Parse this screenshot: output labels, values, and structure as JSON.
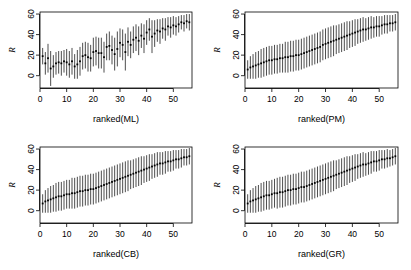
{
  "figure": {
    "layout": "2x2",
    "background": "#ffffff",
    "ink": "#000000"
  },
  "chart_data": [
    {
      "type": "scatter",
      "panel": "top-left",
      "title": "",
      "xlabel": "ranked(ML)",
      "ylabel": "R",
      "xlim": [
        0,
        57
      ],
      "ylim": [
        -12,
        62
      ],
      "xticks": [
        0,
        10,
        20,
        30,
        40,
        50
      ],
      "yticks": [
        0,
        20,
        40,
        60
      ],
      "grid": false,
      "errorbars": true,
      "x": [
        1,
        2,
        3,
        4,
        5,
        6,
        7,
        8,
        9,
        10,
        11,
        12,
        13,
        14,
        15,
        16,
        17,
        18,
        19,
        20,
        21,
        22,
        23,
        24,
        25,
        26,
        27,
        28,
        29,
        30,
        31,
        32,
        33,
        34,
        35,
        36,
        37,
        38,
        39,
        40,
        41,
        42,
        43,
        44,
        45,
        46,
        47,
        48,
        49,
        50,
        51,
        52,
        53,
        54,
        55,
        56
      ],
      "values": [
        19,
        12,
        17,
        7,
        9,
        12,
        13,
        12,
        14,
        13,
        11,
        14,
        9,
        11,
        14,
        19,
        20,
        18,
        17,
        23,
        24,
        22,
        22,
        18,
        28,
        29,
        25,
        21,
        26,
        32,
        30,
        23,
        33,
        30,
        35,
        37,
        34,
        39,
        36,
        42,
        45,
        38,
        41,
        44,
        43,
        46,
        45,
        48,
        47,
        49,
        48,
        50,
        52,
        51,
        53,
        52
      ],
      "err_low": [
        8,
        11,
        14,
        17,
        11,
        11,
        11,
        12,
        11,
        13,
        13,
        13,
        12,
        14,
        14,
        13,
        13,
        14,
        13,
        14,
        14,
        15,
        15,
        15,
        13,
        14,
        14,
        16,
        17,
        14,
        15,
        18,
        14,
        13,
        13,
        13,
        14,
        12,
        14,
        12,
        11,
        16,
        13,
        11,
        12,
        10,
        11,
        9,
        10,
        9,
        9,
        8,
        7,
        8,
        7,
        8
      ],
      "err_high": [
        8,
        11,
        14,
        17,
        11,
        11,
        11,
        12,
        11,
        13,
        13,
        13,
        12,
        14,
        14,
        13,
        13,
        14,
        13,
        14,
        14,
        15,
        15,
        15,
        13,
        14,
        14,
        16,
        17,
        14,
        15,
        18,
        14,
        13,
        13,
        13,
        14,
        12,
        14,
        12,
        11,
        16,
        13,
        11,
        12,
        10,
        11,
        9,
        10,
        9,
        9,
        8,
        7,
        8,
        7,
        8
      ]
    },
    {
      "type": "scatter",
      "panel": "top-right",
      "title": "",
      "xlabel": "ranked(PM)",
      "ylabel": "R",
      "xlim": [
        0,
        57
      ],
      "ylim": [
        -12,
        62
      ],
      "xticks": [
        0,
        10,
        20,
        30,
        40,
        50
      ],
      "yticks": [
        0,
        20,
        40,
        60
      ],
      "grid": false,
      "errorbars": true,
      "x": [
        1,
        2,
        3,
        4,
        5,
        6,
        7,
        8,
        9,
        10,
        11,
        12,
        13,
        14,
        15,
        16,
        17,
        18,
        19,
        20,
        21,
        22,
        23,
        24,
        25,
        26,
        27,
        28,
        29,
        30,
        31,
        32,
        33,
        34,
        35,
        36,
        37,
        38,
        39,
        40,
        41,
        42,
        43,
        44,
        45,
        46,
        47,
        48,
        49,
        50,
        51,
        52,
        53,
        54,
        55,
        56
      ],
      "values": [
        6,
        8,
        9,
        10,
        11,
        12,
        13,
        14,
        15,
        15,
        16,
        16,
        17,
        17,
        18,
        18,
        19,
        19,
        20,
        20,
        21,
        22,
        23,
        24,
        25,
        26,
        27,
        28,
        30,
        31,
        32,
        33,
        34,
        35,
        36,
        37,
        38,
        39,
        40,
        41,
        42,
        43,
        44,
        45,
        45,
        46,
        47,
        47,
        48,
        48,
        49,
        50,
        50,
        51,
        51,
        52
      ],
      "err_low": [
        9,
        11,
        12,
        13,
        13,
        14,
        14,
        14,
        14,
        14,
        14,
        14,
        14,
        14,
        15,
        15,
        15,
        15,
        15,
        15,
        15,
        15,
        15,
        15,
        15,
        15,
        15,
        15,
        15,
        15,
        15,
        15,
        15,
        14,
        14,
        14,
        14,
        14,
        13,
        13,
        13,
        12,
        12,
        12,
        11,
        11,
        11,
        10,
        10,
        10,
        9,
        9,
        9,
        8,
        8,
        8
      ],
      "err_high": [
        9,
        11,
        12,
        13,
        13,
        14,
        14,
        14,
        14,
        14,
        14,
        14,
        14,
        14,
        15,
        15,
        15,
        15,
        15,
        15,
        15,
        15,
        15,
        15,
        15,
        15,
        15,
        15,
        15,
        15,
        15,
        15,
        15,
        14,
        14,
        14,
        14,
        14,
        13,
        13,
        13,
        12,
        12,
        12,
        11,
        11,
        11,
        10,
        10,
        10,
        9,
        9,
        9,
        8,
        8,
        8
      ]
    },
    {
      "type": "scatter",
      "panel": "bottom-left",
      "title": "",
      "xlabel": "ranked(CB)",
      "ylabel": "R",
      "xlim": [
        0,
        57
      ],
      "ylim": [
        -12,
        62
      ],
      "xticks": [
        0,
        10,
        20,
        30,
        40,
        50
      ],
      "yticks": [
        0,
        20,
        40,
        60
      ],
      "grid": false,
      "errorbars": true,
      "x": [
        1,
        2,
        3,
        4,
        5,
        6,
        7,
        8,
        9,
        10,
        11,
        12,
        13,
        14,
        15,
        16,
        17,
        18,
        19,
        20,
        21,
        22,
        23,
        24,
        25,
        26,
        27,
        28,
        29,
        30,
        31,
        32,
        33,
        34,
        35,
        36,
        37,
        38,
        39,
        40,
        41,
        42,
        43,
        44,
        45,
        46,
        47,
        48,
        49,
        50,
        51,
        52,
        53,
        54,
        55,
        56
      ],
      "values": [
        7,
        9,
        10,
        11,
        12,
        13,
        14,
        14,
        15,
        16,
        16,
        17,
        17,
        18,
        19,
        19,
        20,
        20,
        21,
        21,
        22,
        23,
        24,
        25,
        26,
        27,
        28,
        29,
        30,
        31,
        32,
        33,
        34,
        35,
        36,
        37,
        38,
        39,
        40,
        41,
        42,
        43,
        44,
        45,
        46,
        46,
        47,
        48,
        48,
        49,
        50,
        50,
        51,
        52,
        52,
        53
      ],
      "err_low": [
        9,
        11,
        12,
        13,
        13,
        14,
        14,
        14,
        14,
        14,
        14,
        15,
        15,
        15,
        15,
        15,
        15,
        15,
        15,
        15,
        15,
        15,
        15,
        15,
        15,
        15,
        15,
        15,
        15,
        15,
        15,
        15,
        15,
        14,
        14,
        14,
        14,
        14,
        13,
        13,
        13,
        12,
        12,
        12,
        11,
        11,
        11,
        10,
        10,
        10,
        9,
        9,
        9,
        8,
        8,
        8
      ],
      "err_high": [
        9,
        11,
        12,
        13,
        13,
        14,
        14,
        14,
        14,
        14,
        14,
        15,
        15,
        15,
        15,
        15,
        15,
        15,
        15,
        15,
        15,
        15,
        15,
        15,
        15,
        15,
        15,
        15,
        15,
        15,
        15,
        15,
        15,
        14,
        14,
        14,
        14,
        14,
        13,
        13,
        13,
        12,
        12,
        12,
        11,
        11,
        11,
        10,
        10,
        10,
        9,
        9,
        9,
        8,
        8,
        8
      ]
    },
    {
      "type": "scatter",
      "panel": "bottom-right",
      "title": "",
      "xlabel": "ranked(GR)",
      "ylabel": "R",
      "xlim": [
        0,
        57
      ],
      "ylim": [
        -12,
        62
      ],
      "xticks": [
        0,
        10,
        20,
        30,
        40,
        50
      ],
      "yticks": [
        0,
        20,
        40,
        60
      ],
      "grid": false,
      "errorbars": true,
      "x": [
        1,
        2,
        3,
        4,
        5,
        6,
        7,
        8,
        9,
        10,
        11,
        12,
        13,
        14,
        15,
        16,
        17,
        18,
        19,
        20,
        21,
        22,
        23,
        24,
        25,
        26,
        27,
        28,
        29,
        30,
        31,
        32,
        33,
        34,
        35,
        36,
        37,
        38,
        39,
        40,
        41,
        42,
        43,
        44,
        45,
        46,
        47,
        48,
        49,
        50,
        51,
        52,
        53,
        54,
        55,
        56
      ],
      "values": [
        7,
        9,
        10,
        11,
        12,
        13,
        14,
        15,
        15,
        16,
        17,
        17,
        18,
        18,
        19,
        20,
        20,
        21,
        21,
        22,
        23,
        23,
        24,
        25,
        26,
        27,
        28,
        29,
        30,
        31,
        32,
        33,
        34,
        35,
        36,
        37,
        38,
        39,
        40,
        41,
        42,
        43,
        44,
        45,
        45,
        46,
        47,
        48,
        48,
        49,
        50,
        50,
        51,
        51,
        52,
        53
      ],
      "err_low": [
        9,
        11,
        12,
        13,
        13,
        14,
        14,
        14,
        14,
        14,
        14,
        15,
        15,
        15,
        15,
        15,
        15,
        15,
        15,
        15,
        15,
        15,
        15,
        15,
        15,
        15,
        15,
        15,
        15,
        15,
        15,
        15,
        15,
        14,
        14,
        14,
        14,
        14,
        13,
        13,
        13,
        12,
        12,
        12,
        11,
        11,
        11,
        10,
        10,
        10,
        9,
        9,
        9,
        8,
        8,
        8
      ],
      "err_high": [
        9,
        11,
        12,
        13,
        13,
        14,
        14,
        14,
        14,
        14,
        14,
        15,
        15,
        15,
        15,
        15,
        15,
        15,
        15,
        15,
        15,
        15,
        15,
        15,
        15,
        15,
        15,
        15,
        15,
        15,
        15,
        15,
        15,
        14,
        14,
        14,
        14,
        14,
        13,
        13,
        13,
        12,
        12,
        12,
        11,
        11,
        11,
        10,
        10,
        10,
        9,
        9,
        9,
        8,
        8,
        8
      ]
    }
  ]
}
